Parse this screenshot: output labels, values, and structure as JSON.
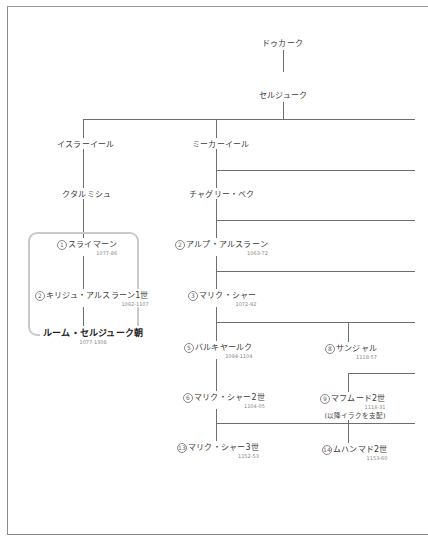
{
  "diagram": {
    "nodes": {
      "duqaq": {
        "name": "ドゥカーク"
      },
      "seljuk": {
        "name": "セルジューク"
      },
      "israil": {
        "name": "イスラーイール"
      },
      "mikail": {
        "name": "ミーカーイール"
      },
      "qutalmish": {
        "name": "クタルミシュ"
      },
      "chaghri": {
        "name": "チャグリー・ベク"
      },
      "suleyman": {
        "num": "1",
        "name": "スライマーン",
        "years": "1077-86"
      },
      "kilij": {
        "num": "2",
        "name": "キリジュ・アルスラーン1世",
        "years": "1092-1107"
      },
      "rum": {
        "name": "ルーム・セルジューク朝",
        "years": "1077-1308"
      },
      "alp": {
        "num": "2",
        "name": "アルプ・アルスラーン",
        "years": "1063-72"
      },
      "malik1": {
        "num": "3",
        "name": "マリク・シャー",
        "years": "1072-92"
      },
      "barkiyaruq": {
        "num": "5",
        "name": "バルキヤールク",
        "years": "1094-1104"
      },
      "sanjar": {
        "num": "8",
        "name": "サンジャル",
        "years": "1118-57"
      },
      "malik2": {
        "num": "6",
        "name": "マリク・シャー2世",
        "years": "1104-05"
      },
      "mahmud2": {
        "num": "9",
        "name": "マフムード2世",
        "years": "1118-31",
        "note": "(以降イラクを支配)"
      },
      "malik3": {
        "num": "13",
        "name": "マリク・シャー3世",
        "years": "1152-53"
      },
      "muhammad2": {
        "num": "14",
        "name": "ムハンマド2世",
        "years": "1153-60"
      }
    },
    "colors": {
      "line": "#6e6e6e",
      "box_border": "#c9c9c9",
      "frame": "#8a8a8a"
    }
  }
}
